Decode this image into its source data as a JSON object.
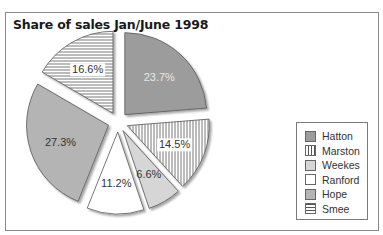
{
  "chart_data": {
    "type": "pie",
    "title": "Share of sales Jan/June 1998",
    "exploded": true,
    "legend_position": "right",
    "slices": [
      {
        "name": "Hatton",
        "value": 23.7,
        "label": "23.7%",
        "fill": "#9c9c9c",
        "pattern": "solid",
        "label_color": "#e8e8e8"
      },
      {
        "name": "Marston",
        "value": 14.5,
        "label": "14.5%",
        "fill": "#ffffff",
        "pattern": "vertical-lines",
        "label_color": "#333333"
      },
      {
        "name": "Weekes",
        "value": 6.6,
        "label": "6.6%",
        "fill": "#d6d6d6",
        "pattern": "solid",
        "label_color": "#333333"
      },
      {
        "name": "Ranford",
        "value": 11.2,
        "label": "11.2%",
        "fill": "#ffffff",
        "pattern": "solid",
        "label_color": "#333333"
      },
      {
        "name": "Hope",
        "value": 27.3,
        "label": "27.3%",
        "fill": "#b4b4b4",
        "pattern": "solid",
        "label_color": "#333333"
      },
      {
        "name": "Smee",
        "value": 16.6,
        "label": "16.6%",
        "fill": "#ffffff",
        "pattern": "horizontal-lines",
        "label_color": "#333333"
      }
    ]
  },
  "legend": {
    "items": [
      {
        "label": "Hatton"
      },
      {
        "label": "Marston"
      },
      {
        "label": "Weekes"
      },
      {
        "label": "Ranford"
      },
      {
        "label": "Hope"
      },
      {
        "label": "Smee"
      }
    ]
  }
}
